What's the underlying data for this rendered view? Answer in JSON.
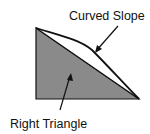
{
  "diagram": {
    "labels": {
      "curved_slope": "Curved Slope",
      "right_triangle": "Right Triangle"
    },
    "colors": {
      "triangle_fill": "#8a8a8a",
      "stroke": "#111111",
      "background": "#ffffff"
    }
  }
}
